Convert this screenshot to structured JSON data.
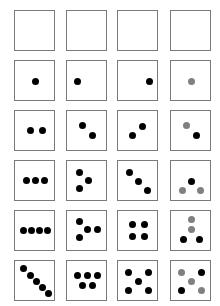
{
  "colors": {
    "black": "#000000",
    "gray": "#808080",
    "border": "#7a7a7a"
  },
  "grid": {
    "columns": 4,
    "rows": 6,
    "col_x": [
      14,
      66,
      117,
      170
    ],
    "row_y": [
      10,
      60,
      110,
      160,
      210,
      260
    ],
    "cells": [
      [
        {
          "dots": []
        },
        {
          "dots": []
        },
        {
          "dots": []
        },
        {
          "dots": []
        }
      ],
      [
        {
          "dots": [
            [
              20,
              20,
              "black"
            ]
          ]
        },
        {
          "dots": [
            [
              10,
              20,
              "black"
            ]
          ]
        },
        {
          "dots": [
            [
              31,
              20,
              "black"
            ]
          ]
        },
        {
          "dots": [
            [
              20,
              20,
              "gray"
            ]
          ]
        }
      ],
      [
        {
          "dots": [
            [
              15,
              19,
              "black"
            ],
            [
              27,
              19,
              "black"
            ]
          ]
        },
        {
          "dots": [
            [
              15,
              14,
              "black"
            ],
            [
              25,
              24,
              "black"
            ]
          ]
        },
        {
          "dots": [
            [
              24,
              15,
              "black"
            ],
            [
              14,
              24,
              "black"
            ]
          ]
        },
        {
          "dots": [
            [
              15,
              14,
              "gray"
            ],
            [
              25,
              24,
              "black"
            ]
          ]
        }
      ],
      [
        {
          "dots": [
            [
              11,
              19,
              "black"
            ],
            [
              20,
              19,
              "black"
            ],
            [
              29,
              19,
              "black"
            ]
          ]
        },
        {
          "dots": [
            [
              12,
              11,
              "black"
            ],
            [
              21,
              19,
              "black"
            ],
            [
              12,
              27,
              "black"
            ]
          ]
        },
        {
          "dots": [
            [
              11,
              11,
              "black"
            ],
            [
              20,
              20,
              "black"
            ],
            [
              29,
              29,
              "black"
            ]
          ]
        },
        {
          "dots": [
            [
              20,
              20,
              "black"
            ],
            [
              11,
              29,
              "gray"
            ],
            [
              29,
              29,
              "gray"
            ]
          ]
        }
      ],
      [
        {
          "dots": [
            [
              8,
              19,
              "black"
            ],
            [
              16,
              19,
              "black"
            ],
            [
              24,
              19,
              "black"
            ],
            [
              32,
              19,
              "black"
            ]
          ]
        },
        {
          "dots": [
            [
              12,
              10,
              "black"
            ],
            [
              20,
              18,
              "black"
            ],
            [
              30,
              18,
              "black"
            ],
            [
              12,
              26,
              "black"
            ]
          ]
        },
        {
          "dots": [
            [
              14,
              13,
              "black"
            ],
            [
              26,
              13,
              "black"
            ],
            [
              14,
              25,
              "black"
            ],
            [
              26,
              25,
              "black"
            ]
          ]
        },
        {
          "dots": [
            [
              20,
              8,
              "gray"
            ],
            [
              20,
              18,
              "gray"
            ],
            [
              12,
              28,
              "black"
            ],
            [
              28,
              28,
              "black"
            ]
          ]
        }
      ],
      [
        {
          "dots": [
            [
              8,
              7,
              "black"
            ],
            [
              15,
              14,
              "black"
            ],
            [
              21,
              20,
              "black"
            ],
            [
              27,
              26,
              "black"
            ],
            [
              33,
              32,
              "black"
            ]
          ]
        },
        {
          "dots": [
            [
              10,
              14,
              "black"
            ],
            [
              20,
              14,
              "black"
            ],
            [
              30,
              14,
              "black"
            ],
            [
              15,
              24,
              "black"
            ],
            [
              25,
              24,
              "black"
            ]
          ]
        },
        {
          "dots": [
            [
              10,
              11,
              "black"
            ],
            [
              30,
              11,
              "black"
            ],
            [
              20,
              20,
              "black"
            ],
            [
              10,
              29,
              "black"
            ],
            [
              30,
              29,
              "black"
            ]
          ]
        },
        {
          "dots": [
            [
              10,
              11,
              "gray"
            ],
            [
              30,
              11,
              "black"
            ],
            [
              20,
              20,
              "gray"
            ],
            [
              10,
              29,
              "black"
            ],
            [
              30,
              29,
              "gray"
            ]
          ]
        }
      ]
    ]
  }
}
